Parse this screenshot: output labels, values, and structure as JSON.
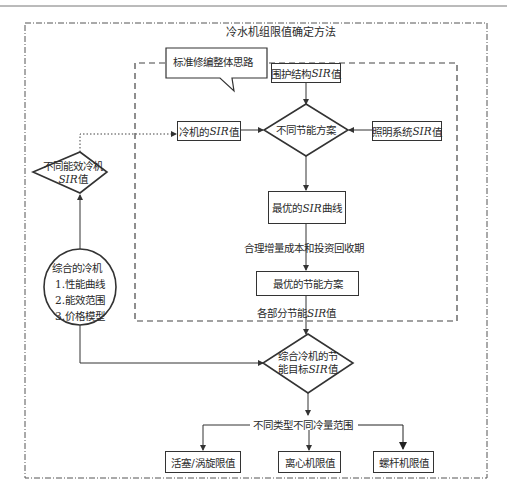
{
  "diagram": {
    "title": "冷水机组限值确定方法",
    "callout": "标准修编整体思路",
    "nodes": {
      "envelope_sir": {
        "text": "围护结构",
        "italic": "SIR",
        "suffix": "值"
      },
      "chiller_sir": {
        "text": "冷机的",
        "italic": "SIR",
        "suffix": "值"
      },
      "energy_plans": {
        "text": "不同节能方案"
      },
      "lighting_sir": {
        "text": "照明系统",
        "italic": "SIR",
        "suffix": "值"
      },
      "optimal_sir_curve": {
        "text": "最优的",
        "italic": "SIR",
        "suffix": "曲线"
      },
      "optimal_plan": {
        "text": "最优的节能方案"
      },
      "diff_efficiency_chiller": {
        "line1": "不同能效冷机",
        "italic": "SIR",
        "suffix": "值"
      },
      "composite_chiller": {
        "title": "综合的冷机",
        "items": [
          "1.性能曲线",
          "2.能效范围",
          "3.价格模型"
        ]
      },
      "composite_target": {
        "line1": "综合冷机的节",
        "line2_prefix": "能目标",
        "italic": "SIR",
        "suffix": "值"
      },
      "piston_scroll_limit": {
        "text": "活塞/涡旋限值"
      },
      "centrifugal_limit": {
        "text": "离心机限值"
      },
      "screw_limit": {
        "text": "螺杆机限值"
      }
    },
    "edge_labels": {
      "cost_payback": "合理增量成本和投资回收期",
      "partial_sir_prefix": "各部分节能",
      "partial_sir_italic": "SIR",
      "partial_sir_suffix": "值",
      "type_range": "不同类型不同冷量范围"
    },
    "colors": {
      "line": "#333333",
      "frame": "#555555",
      "background": "#ffffff"
    }
  }
}
